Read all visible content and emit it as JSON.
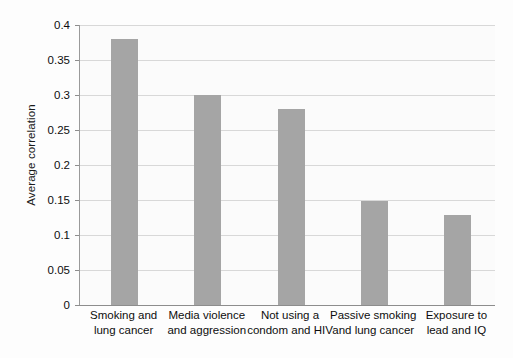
{
  "chart_data": {
    "type": "bar",
    "title": "",
    "subtitle": "",
    "xlabel": "",
    "ylabel": "Average correlation",
    "ylim": [
      0,
      0.4
    ],
    "yticks": [
      "0",
      "0.05",
      "0.1",
      "0.15",
      "0.2",
      "0.25",
      "0.3",
      "0.35",
      "0.4"
    ],
    "ytick_values": [
      0,
      0.05,
      0.1,
      0.15,
      0.2,
      0.25,
      0.3,
      0.35,
      0.4
    ],
    "grid": true,
    "legend": "none",
    "bar_color": "#a5a5a5",
    "categories": [
      "Smoking and lung cancer",
      "Media violence and aggression",
      "Not using a condom and HIV",
      "Passive smoking and lung cancer",
      "Exposure to lead and IQ"
    ],
    "category_lines": [
      [
        "Smoking and",
        "lung cancer"
      ],
      [
        "Media violence",
        "and aggression"
      ],
      [
        "Not using a",
        "condom and HIV"
      ],
      [
        "Passive smoking",
        "and lung cancer"
      ],
      [
        "Exposure to",
        "lead and IQ"
      ]
    ],
    "values": [
      0.38,
      0.3,
      0.28,
      0.148,
      0.128
    ]
  }
}
